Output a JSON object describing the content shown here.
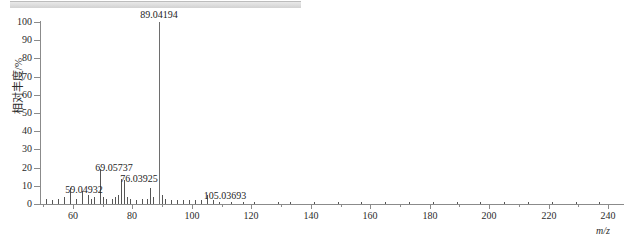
{
  "window": {
    "top_band": "scrollbar-band"
  },
  "chart_data": {
    "type": "bar",
    "title": "",
    "xlabel": "m/z",
    "ylabel": "相对丰度/%",
    "xlim": [
      47,
      243
    ],
    "ylim": [
      0,
      100
    ],
    "grid": false,
    "legend": null,
    "x_ticks": [
      60,
      80,
      100,
      120,
      140,
      160,
      180,
      200,
      220,
      240
    ],
    "x_minor_step": 10,
    "y_ticks": [
      0,
      10,
      20,
      30,
      40,
      50,
      60,
      70,
      80,
      90,
      100
    ],
    "labeled_peaks": [
      {
        "mz": 59.04932,
        "label": "59.04932",
        "intensity": 9
      },
      {
        "mz": 69.05737,
        "label": "69.05737",
        "intensity": 19
      },
      {
        "mz": 76.03925,
        "label": "76.03925",
        "intensity": 14
      },
      {
        "mz": 89.04194,
        "label": "89.04194",
        "intensity": 100
      },
      {
        "mz": 105.03693,
        "label": "105.03693",
        "intensity": 5
      }
    ],
    "peaks": [
      {
        "mz": 51.0,
        "intensity": 3
      },
      {
        "mz": 53.0,
        "intensity": 2
      },
      {
        "mz": 55.02,
        "intensity": 3
      },
      {
        "mz": 57.03,
        "intensity": 4
      },
      {
        "mz": 59.04932,
        "intensity": 9
      },
      {
        "mz": 61.01,
        "intensity": 3
      },
      {
        "mz": 63.02,
        "intensity": 7
      },
      {
        "mz": 65.04,
        "intensity": 5
      },
      {
        "mz": 66.05,
        "intensity": 3
      },
      {
        "mz": 67.05,
        "intensity": 4
      },
      {
        "mz": 69.05737,
        "intensity": 19
      },
      {
        "mz": 70.06,
        "intensity": 4
      },
      {
        "mz": 71.05,
        "intensity": 3
      },
      {
        "mz": 73.02,
        "intensity": 3
      },
      {
        "mz": 74.02,
        "intensity": 4
      },
      {
        "mz": 75.03,
        "intensity": 5
      },
      {
        "mz": 76.03925,
        "intensity": 14
      },
      {
        "mz": 77.04,
        "intensity": 13
      },
      {
        "mz": 78.04,
        "intensity": 4
      },
      {
        "mz": 79.05,
        "intensity": 3
      },
      {
        "mz": 81.03,
        "intensity": 2
      },
      {
        "mz": 83.05,
        "intensity": 3
      },
      {
        "mz": 85.03,
        "intensity": 3
      },
      {
        "mz": 86.04,
        "intensity": 9
      },
      {
        "mz": 87.04,
        "intensity": 4
      },
      {
        "mz": 89.04194,
        "intensity": 100
      },
      {
        "mz": 90.05,
        "intensity": 5
      },
      {
        "mz": 91.05,
        "intensity": 3
      },
      {
        "mz": 93.04,
        "intensity": 2
      },
      {
        "mz": 95.05,
        "intensity": 2
      },
      {
        "mz": 97.06,
        "intensity": 2
      },
      {
        "mz": 99.04,
        "intensity": 2
      },
      {
        "mz": 101.04,
        "intensity": 2
      },
      {
        "mz": 103.03,
        "intensity": 2
      },
      {
        "mz": 105.03693,
        "intensity": 5
      },
      {
        "mz": 107.04,
        "intensity": 2
      },
      {
        "mz": 109.05,
        "intensity": 1
      },
      {
        "mz": 113.05,
        "intensity": 1
      },
      {
        "mz": 117.04,
        "intensity": 1
      },
      {
        "mz": 121.05,
        "intensity": 1
      },
      {
        "mz": 129.05,
        "intensity": 1
      },
      {
        "mz": 133.05,
        "intensity": 1
      },
      {
        "mz": 141.06,
        "intensity": 1
      },
      {
        "mz": 149.04,
        "intensity": 1
      },
      {
        "mz": 157.06,
        "intensity": 1
      },
      {
        "mz": 165.07,
        "intensity": 1
      },
      {
        "mz": 173.06,
        "intensity": 1
      },
      {
        "mz": 181.07,
        "intensity": 1
      },
      {
        "mz": 189.07,
        "intensity": 1
      },
      {
        "mz": 197.08,
        "intensity": 1
      },
      {
        "mz": 205.08,
        "intensity": 1
      },
      {
        "mz": 213.09,
        "intensity": 1
      },
      {
        "mz": 221.09,
        "intensity": 1
      },
      {
        "mz": 229.1,
        "intensity": 1
      },
      {
        "mz": 237.1,
        "intensity": 1
      }
    ],
    "label_positions": [
      {
        "label": "59.04932",
        "mz": 59.04932,
        "top": 185,
        "dx": 14
      },
      {
        "label": "69.05737",
        "mz": 69.05737,
        "top": 163,
        "dx": 14
      },
      {
        "label": "76.03925",
        "mz": 76.03925,
        "top": 174,
        "dx": 18
      },
      {
        "label": "89.04194",
        "mz": 89.04194,
        "top": 10,
        "dx": 0
      },
      {
        "label": "105.03693",
        "mz": 105.03693,
        "top": 191,
        "dx": 18
      }
    ],
    "colors": {
      "axis": "#8b8b8b",
      "peak": "#555555",
      "text": "#1d1d1d",
      "background": "#ffffff"
    }
  }
}
